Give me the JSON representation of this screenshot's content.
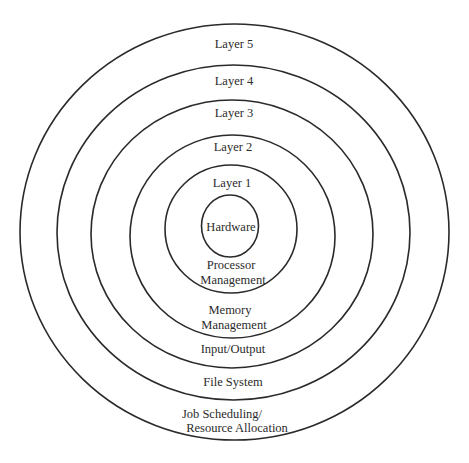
{
  "diagram": {
    "type": "concentric-rings",
    "colors": {
      "background": "#ffffff",
      "stroke": "#2a2a2a",
      "text": "#2b2b2b"
    },
    "rings": [
      {
        "name": "layer-5",
        "label": "Layer 5",
        "function_lines": [
          "Job Scheduling/",
          "Resource Allocation"
        ]
      },
      {
        "name": "layer-4",
        "label": "Layer 4",
        "function_lines": [
          "File System"
        ]
      },
      {
        "name": "layer-3",
        "label": "Layer 3",
        "function_lines": [
          "Input/Output"
        ]
      },
      {
        "name": "layer-2",
        "label": "Layer 2",
        "function_lines": [
          "Memory",
          "Management"
        ]
      },
      {
        "name": "layer-1",
        "label": "Layer 1",
        "function_lines": [
          "Processor",
          "Management"
        ]
      }
    ],
    "core": {
      "label": "Hardware"
    }
  }
}
